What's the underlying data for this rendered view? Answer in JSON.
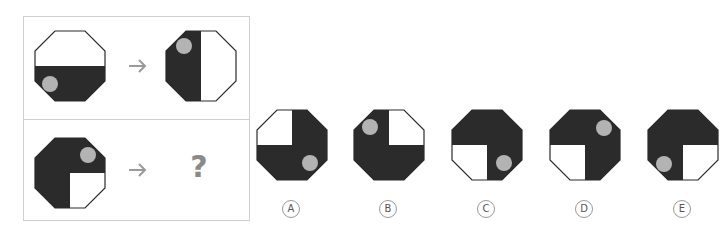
{
  "colors": {
    "dark": "#2b2b2b",
    "circle": "#b3b3b3",
    "outline": "#2b2b2b",
    "arrow": "#9a9a9a",
    "border": "#cfcfcf"
  },
  "question": {
    "row1": {
      "arrow": "→"
    },
    "row2": {
      "arrow": "→",
      "unknown": "?"
    }
  },
  "options": [
    {
      "label": "A"
    },
    {
      "label": "B"
    },
    {
      "label": "C"
    },
    {
      "label": "D"
    },
    {
      "label": "E"
    }
  ]
}
